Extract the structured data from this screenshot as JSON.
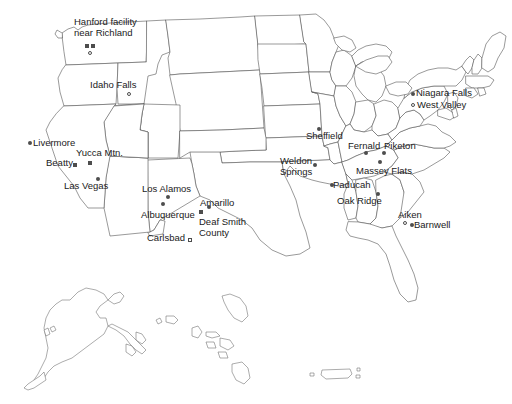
{
  "map": {
    "title": "United States map of nuclear waste sites",
    "width": 512,
    "height": 404,
    "background_color": "#ffffff",
    "outline_color": "#555555",
    "marker_color": "#4d4d4d",
    "label_color": "#1a1a1a"
  },
  "sites": [
    {
      "id": "hanford",
      "label": "Hanford facility\nnear Richland",
      "label_x": 74,
      "label_y": 17,
      "markers": [
        {
          "shape": "square-filled",
          "x": 85,
          "y": 44
        },
        {
          "shape": "square-filled",
          "x": 91,
          "y": 44
        },
        {
          "shape": "circle-open",
          "x": 88,
          "y": 51
        }
      ]
    },
    {
      "id": "idaho-falls",
      "label": "Idaho Falls",
      "label_x": 90,
      "label_y": 80,
      "markers": [
        {
          "shape": "circle-open",
          "x": 127,
          "y": 92
        }
      ]
    },
    {
      "id": "livermore",
      "label": "Livermore",
      "label_x": 33,
      "label_y": 138,
      "markers": [
        {
          "shape": "dot",
          "x": 28,
          "y": 141
        }
      ]
    },
    {
      "id": "beatty",
      "label": "Beatty",
      "label_x": 46,
      "label_y": 158,
      "markers": [
        {
          "shape": "square-filled",
          "x": 73,
          "y": 163
        }
      ]
    },
    {
      "id": "yucca-mtn",
      "label": "Yucca Mtn.",
      "label_x": 76,
      "label_y": 148,
      "markers": [
        {
          "shape": "square-filled",
          "x": 88,
          "y": 161
        }
      ]
    },
    {
      "id": "las-vegas",
      "label": "Las Vegas",
      "label_x": 64,
      "label_y": 181,
      "markers": [
        {
          "shape": "dot",
          "x": 96,
          "y": 177
        }
      ]
    },
    {
      "id": "los-alamos",
      "label": "Los Alamos",
      "label_x": 142,
      "label_y": 184,
      "markers": [
        {
          "shape": "dot",
          "x": 166,
          "y": 195
        }
      ]
    },
    {
      "id": "albuquerque",
      "label": "Albuquerque",
      "label_x": 141,
      "label_y": 210,
      "markers": [
        {
          "shape": "dot",
          "x": 161,
          "y": 202
        }
      ]
    },
    {
      "id": "carlsbad",
      "label": "Carlsbad",
      "label_x": 147,
      "label_y": 233,
      "markers": [
        {
          "shape": "square-open",
          "x": 188,
          "y": 238
        }
      ]
    },
    {
      "id": "amarillo",
      "label": "Amarillo",
      "label_x": 200,
      "label_y": 198,
      "markers": [
        {
          "shape": "dot",
          "x": 207,
          "y": 205
        }
      ]
    },
    {
      "id": "deaf-smith-county",
      "label": "Deaf Smith\nCounty",
      "label_x": 199,
      "label_y": 217,
      "markers": [
        {
          "shape": "square-filled",
          "x": 199,
          "y": 210
        }
      ]
    },
    {
      "id": "sheffield",
      "label": "Sheffield",
      "label_x": 306,
      "label_y": 131,
      "markers": [
        {
          "shape": "dot",
          "x": 317,
          "y": 127
        }
      ]
    },
    {
      "id": "weldon-springs",
      "label": "Weldon\nSprings",
      "label_x": 280,
      "label_y": 156,
      "markers": [
        {
          "shape": "dot",
          "x": 313,
          "y": 163
        }
      ]
    },
    {
      "id": "fernald",
      "label": "Fernald",
      "label_x": 348,
      "label_y": 141,
      "markers": [
        {
          "shape": "dot",
          "x": 364,
          "y": 151
        }
      ]
    },
    {
      "id": "piketon",
      "label": "Piketon",
      "label_x": 384,
      "label_y": 141,
      "markers": [
        {
          "shape": "dot",
          "x": 382,
          "y": 151
        }
      ]
    },
    {
      "id": "massey-flats",
      "label": "Massey Flats",
      "label_x": 356,
      "label_y": 166,
      "markers": [
        {
          "shape": "dot",
          "x": 378,
          "y": 160
        }
      ]
    },
    {
      "id": "paducah",
      "label": "Paducah",
      "label_x": 333,
      "label_y": 180,
      "markers": [
        {
          "shape": "dot",
          "x": 330,
          "y": 183
        }
      ]
    },
    {
      "id": "oak-ridge",
      "label": "Oak Ridge",
      "label_x": 337,
      "label_y": 196,
      "markers": [
        {
          "shape": "dot",
          "x": 376,
          "y": 192
        }
      ]
    },
    {
      "id": "niagara-falls",
      "label": "Niagara Falls",
      "label_x": 416,
      "label_y": 88,
      "markers": [
        {
          "shape": "dot",
          "x": 411,
          "y": 92
        }
      ]
    },
    {
      "id": "west-valley",
      "label": "West Valley",
      "label_x": 417,
      "label_y": 100,
      "markers": [
        {
          "shape": "circle-open",
          "x": 411,
          "y": 103
        }
      ]
    },
    {
      "id": "aiken",
      "label": "Aiken",
      "label_x": 398,
      "label_y": 210,
      "markers": [
        {
          "shape": "circle-open",
          "x": 403,
          "y": 221
        }
      ]
    },
    {
      "id": "barnwell",
      "label": "Barnwell",
      "label_x": 414,
      "label_y": 220,
      "markers": [
        {
          "shape": "dot",
          "x": 410,
          "y": 223
        }
      ]
    }
  ]
}
